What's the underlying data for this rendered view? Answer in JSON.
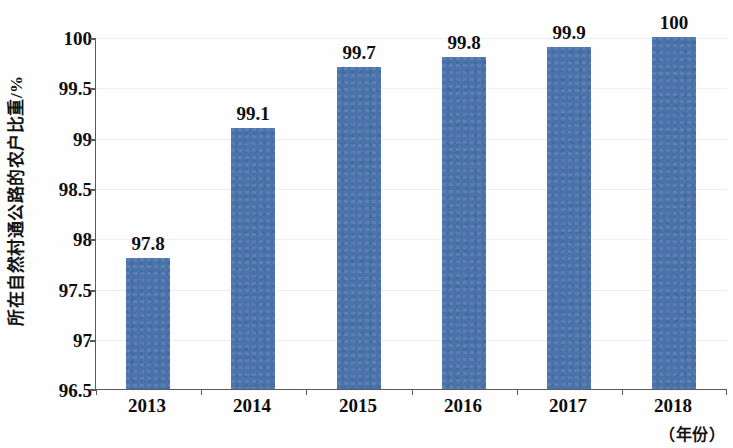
{
  "chart_data": {
    "type": "bar",
    "title": "",
    "xlabel": "（年份）",
    "ylabel": "所在自然村通公路的农户比重/%",
    "categories": [
      "2013",
      "2014",
      "2015",
      "2016",
      "2017",
      "2018"
    ],
    "values": [
      97.8,
      99.1,
      99.7,
      99.8,
      99.9,
      100
    ],
    "value_labels": [
      "97.8",
      "99.1",
      "99.7",
      "99.8",
      "99.9",
      "100"
    ],
    "ylim": [
      96.5,
      100
    ],
    "ytick_labels": [
      "100",
      "99.5",
      "99",
      "98.5",
      "98",
      "97.5",
      "97",
      "96.5"
    ],
    "ytick_values": [
      100,
      99.5,
      99,
      98.5,
      98,
      97.5,
      97,
      96.5
    ],
    "grid": true,
    "legend": false,
    "legend_position": "none",
    "series": [
      {
        "name": "所在自然村通公路的农户比重",
        "values": [
          97.8,
          99.1,
          99.7,
          99.8,
          99.9,
          100
        ]
      }
    ],
    "colors": {
      "bar": "#4a72ab",
      "axis": "#5a5a5a",
      "grid": "#eceff1",
      "text": "#0d0d0d",
      "background": "#fefefe"
    }
  }
}
